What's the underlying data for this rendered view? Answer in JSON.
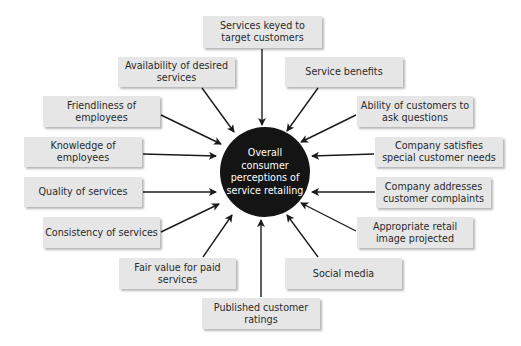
{
  "diagram": {
    "type": "hub-and-spoke",
    "center": {
      "label": "Overall consumer perceptions of service retailing",
      "fill": "#141414",
      "text_color": "#ffffff"
    },
    "box_fill": "#e6e6e6",
    "arrow_color": "#1a1a1a",
    "factors": [
      {
        "id": "services-keyed",
        "label": "Services keyed to target customers"
      },
      {
        "id": "availability",
        "label": "Availability of desired services"
      },
      {
        "id": "service-benefits",
        "label": "Service benefits"
      },
      {
        "id": "friendliness",
        "label": "Friendliness of employees"
      },
      {
        "id": "ability-ask",
        "label": "Ability of customers to ask questions"
      },
      {
        "id": "knowledge",
        "label": "Knowledge of employees"
      },
      {
        "id": "special-needs",
        "label": "Company satisfies special customer needs"
      },
      {
        "id": "quality",
        "label": "Quality of services"
      },
      {
        "id": "complaints",
        "label": "Company addresses customer complaints"
      },
      {
        "id": "consistency",
        "label": "Consistency of services"
      },
      {
        "id": "retail-image",
        "label": "Appropriate retail image projected"
      },
      {
        "id": "fair-value",
        "label": "Fair value for paid services"
      },
      {
        "id": "social-media",
        "label": "Social media"
      },
      {
        "id": "published-ratings",
        "label": "Published customer ratings"
      }
    ]
  }
}
